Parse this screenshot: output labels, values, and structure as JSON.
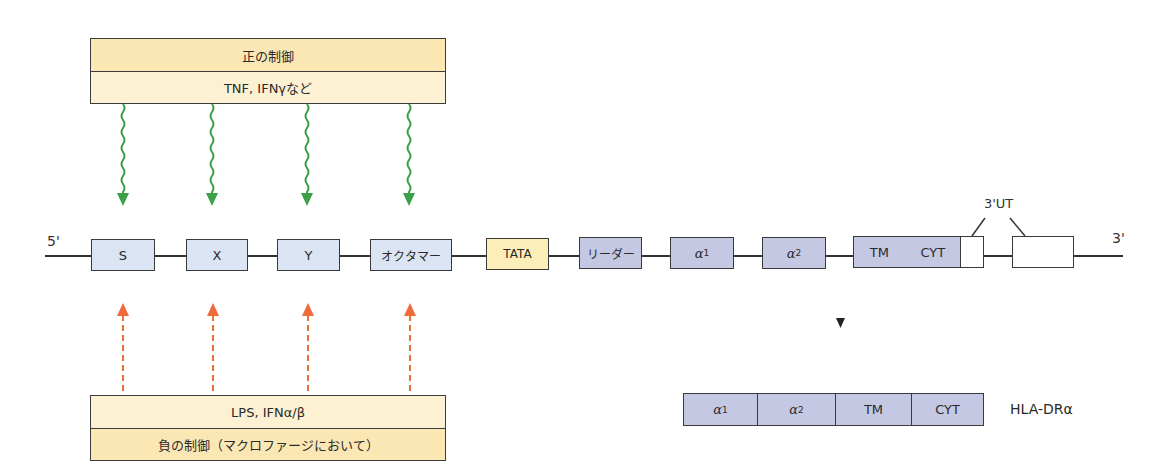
{
  "positive_regulation": {
    "title": "正の制御",
    "factors": "TNF, IFNγなど",
    "arrow_color": "#3aa04a"
  },
  "negative_regulation": {
    "factors": "LPS, IFNα/β",
    "title": "負の制御（マクロファージにおいて）",
    "arrow_color": "#ee6b3a"
  },
  "gene": {
    "five_prime_label": "5'",
    "three_prime_label": "3'",
    "utr_label": "3'UT",
    "segments": [
      {
        "id": "S",
        "label": "S"
      },
      {
        "id": "X",
        "label": "X"
      },
      {
        "id": "Y",
        "label": "Y"
      },
      {
        "id": "octamer",
        "label": "オクタマー"
      },
      {
        "id": "tata",
        "label": "TATA"
      },
      {
        "id": "leader",
        "label": "リーダー"
      },
      {
        "id": "alpha1",
        "label": "α",
        "sub": "1"
      },
      {
        "id": "alpha2",
        "label": "α",
        "sub": "2"
      },
      {
        "id": "tm",
        "label": "TM"
      },
      {
        "id": "cyt",
        "label": "CYT"
      }
    ]
  },
  "protein": {
    "name": "HLA-DRα",
    "domains": [
      {
        "label": "α",
        "sub": "1"
      },
      {
        "label": "α",
        "sub": "2"
      },
      {
        "label": "TM"
      },
      {
        "label": "CYT"
      }
    ]
  },
  "colors": {
    "regulatory_element": "#dbe4f3",
    "exon": "#c4c8e3",
    "tata_box": "#fbeeb8",
    "regulation_box": "#fbe7b4"
  }
}
